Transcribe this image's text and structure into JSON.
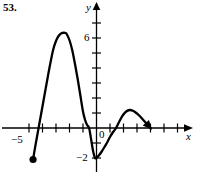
{
  "figure": {
    "problem_number": "53.",
    "axis_labels": {
      "x": "x",
      "y": "y"
    },
    "tick_labels": {
      "y_six": "6",
      "origin": "0",
      "y_neg_two": "−2",
      "x_neg_five": "−5"
    }
  },
  "chart_data": {
    "type": "line",
    "title": "53.",
    "xlabel": "x",
    "ylabel": "y",
    "xlim": [
      -5.7,
      5.6
    ],
    "ylim": [
      -2.6,
      7.6
    ],
    "xticks": [
      -5,
      -4,
      -3,
      -2,
      -1,
      0,
      1,
      2,
      3,
      4,
      5
    ],
    "yticks": [
      -2,
      -1,
      1,
      2,
      3,
      4,
      5,
      6,
      7
    ],
    "xtick_labels_shown": [
      "−5",
      "0"
    ],
    "ytick_labels_shown": [
      "6",
      "−2"
    ],
    "grid": false,
    "legend": null,
    "axis_arrows": {
      "x_right": true,
      "y_up": true
    },
    "endpoints": [
      {
        "kind": "filled-dot",
        "x": -4.7,
        "y": -2.1,
        "note": "closed endpoint at left end of curve"
      },
      {
        "kind": "arrowhead",
        "x": 4.0,
        "y": 0.0,
        "note": "curve terminates on x-axis with arrowhead pointing down-right"
      }
    ],
    "features": [
      {
        "kind": "local-maximum",
        "x": -2.3,
        "y": 6.35
      },
      {
        "kind": "local-minimum",
        "x": -0.1,
        "y": -2.0
      },
      {
        "kind": "local-maximum",
        "x": 2.45,
        "y": 1.2
      },
      {
        "kind": "x-intercept",
        "x": -4.35,
        "y": 0
      },
      {
        "kind": "x-intercept",
        "x": -0.55,
        "y": 0
      },
      {
        "kind": "x-intercept",
        "x": 1.45,
        "y": 0
      },
      {
        "kind": "x-intercept",
        "x": 4.0,
        "y": 0
      }
    ],
    "x": [
      -4.7,
      -4.55,
      -4.4,
      -4.2,
      -4.0,
      -3.8,
      -3.6,
      -3.4,
      -3.2,
      -3.0,
      -2.8,
      -2.6,
      -2.4,
      -2.3,
      -2.2,
      -2.0,
      -1.8,
      -1.6,
      -1.4,
      -1.2,
      -1.0,
      -0.85,
      -0.7,
      -0.55,
      -0.4,
      -0.25,
      -0.1,
      0.05,
      0.2,
      0.4,
      0.6,
      0.8,
      1.0,
      1.2,
      1.45,
      1.7,
      1.95,
      2.2,
      2.45,
      2.7,
      2.95,
      3.2,
      3.45,
      3.7,
      4.0
    ],
    "y": [
      -2.1,
      -1.3,
      -0.55,
      0.45,
      1.45,
      2.45,
      3.45,
      4.4,
      5.25,
      5.8,
      6.15,
      6.32,
      6.35,
      6.33,
      6.25,
      5.85,
      5.2,
      4.3,
      3.3,
      2.2,
      1.1,
      0.55,
      0.2,
      0.0,
      -0.75,
      -1.55,
      -2.0,
      -1.95,
      -1.8,
      -1.55,
      -1.25,
      -0.95,
      -0.6,
      -0.3,
      0.0,
      0.45,
      0.85,
      1.1,
      1.2,
      1.15,
      1.0,
      0.8,
      0.55,
      0.3,
      0.0
    ]
  }
}
